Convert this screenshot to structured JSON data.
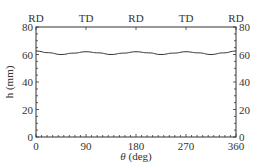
{
  "chart_data": {
    "type": "line",
    "title": "",
    "xlabel": "θ (deg)",
    "xlabel_symbol": "θ",
    "xlabel_unit": "(deg)",
    "ylabel": "h (mm)",
    "xlim": [
      0,
      360
    ],
    "ylim": [
      0,
      80
    ],
    "x_ticks": [
      0,
      90,
      180,
      270,
      360
    ],
    "y_ticks_left": [
      0,
      20,
      40,
      60,
      80
    ],
    "y_ticks_right": [
      0,
      20,
      40,
      60,
      80
    ],
    "top_labels": [
      {
        "x": 0,
        "label": "RD"
      },
      {
        "x": 90,
        "label": "TD"
      },
      {
        "x": 180,
        "label": "RD"
      },
      {
        "x": 270,
        "label": "TD"
      },
      {
        "x": 360,
        "label": "RD"
      }
    ],
    "grid": false,
    "legend": null,
    "series": [
      {
        "name": "h",
        "x": [
          0,
          22.5,
          45,
          67.5,
          90,
          112.5,
          135,
          157.5,
          180,
          202.5,
          225,
          247.5,
          270,
          292.5,
          315,
          337.5,
          360
        ],
        "values": [
          62.5,
          61.3,
          60.0,
          61.0,
          62.0,
          61.2,
          60.0,
          61.0,
          62.0,
          61.2,
          60.0,
          61.0,
          62.0,
          61.2,
          60.0,
          61.2,
          62.5
        ]
      }
    ],
    "colors": {
      "line": "#333333",
      "axes": "#333333"
    }
  }
}
